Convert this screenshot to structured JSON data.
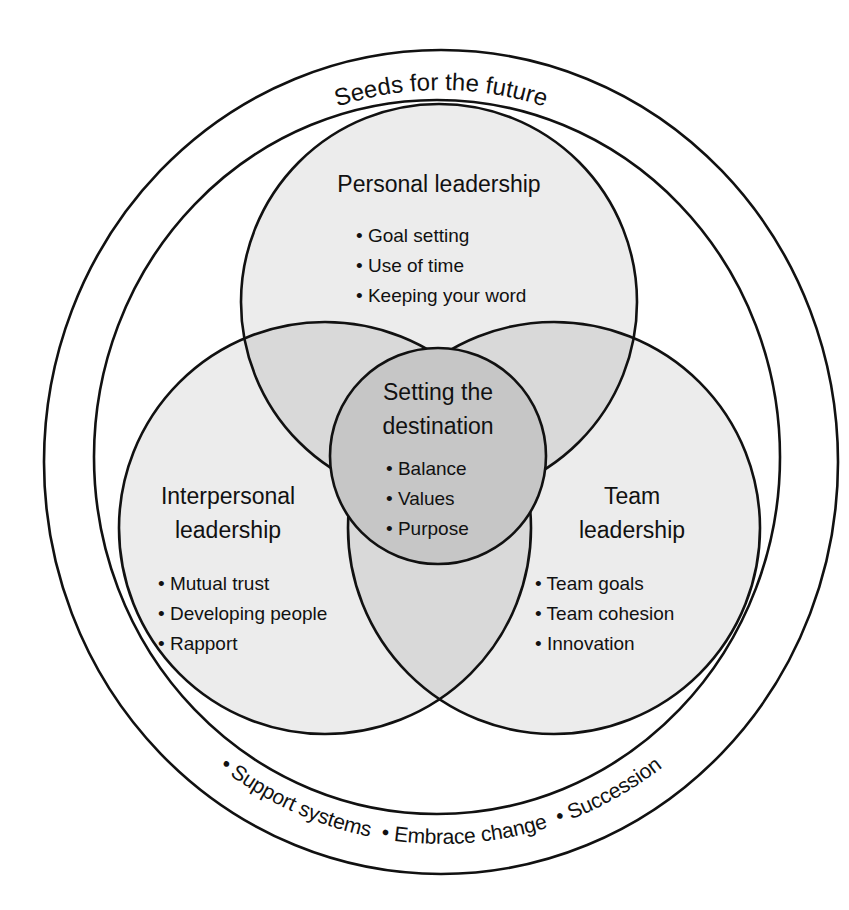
{
  "colors": {
    "line": "#111111",
    "background": "#ffffff",
    "circle_fill": "#ececec",
    "pair_overlap_fill": "#d9d9d9",
    "center_fill": "#c6c6c6"
  },
  "outer_ring": {
    "label": "Seeds for the future",
    "items": [
      "• Support systems",
      "• Embrace change",
      "• Succession"
    ],
    "items_joined": "• Support systems  • Embrace change  • Succession"
  },
  "circles": {
    "personal": {
      "title": "Personal leadership",
      "items": [
        "• Goal setting",
        "• Use of time",
        "• Keeping your word"
      ]
    },
    "interpersonal": {
      "title_line1": "Interpersonal",
      "title_line2": "leadership",
      "items": [
        "• Mutual trust",
        "• Developing people",
        "• Rapport"
      ]
    },
    "team": {
      "title_line1": "Team",
      "title_line2": "leadership",
      "items": [
        "• Team goals",
        "• Team cohesion",
        "• Innovation"
      ]
    },
    "center": {
      "title_line1": "Setting the",
      "title_line2": "destination",
      "items": [
        "• Balance",
        "• Values",
        "• Purpose"
      ]
    }
  }
}
